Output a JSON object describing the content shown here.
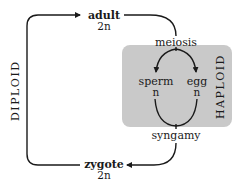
{
  "diagram": {
    "nodes": {
      "adult": {
        "label": "adult",
        "ploidy": "2n"
      },
      "zygote": {
        "label": "zygote",
        "ploidy": "2n"
      },
      "sperm": {
        "label": "sperm",
        "ploidy": "n"
      },
      "egg": {
        "label": "egg",
        "ploidy": "n"
      }
    },
    "processes": {
      "meiosis": "meiosis",
      "syngamy": "syngamy"
    },
    "phases": {
      "diploid": "DIPLOID",
      "haploid": "HAPLOID"
    },
    "colors": {
      "haploid_region": "#c9c9c9",
      "line": "#1a1a1a",
      "background": "#ffffff"
    },
    "edges": [
      {
        "from": "zygote",
        "to": "adult",
        "via": "DIPLOID side"
      },
      {
        "from": "adult",
        "to": "meiosis"
      },
      {
        "from": "meiosis",
        "to": "sperm"
      },
      {
        "from": "meiosis",
        "to": "egg"
      },
      {
        "from": "sperm",
        "to": "syngamy"
      },
      {
        "from": "egg",
        "to": "syngamy"
      },
      {
        "from": "syngamy",
        "to": "zygote"
      }
    ]
  }
}
